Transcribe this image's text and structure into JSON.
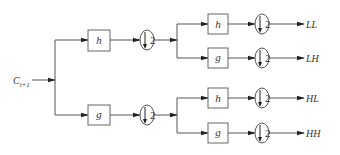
{
  "diagram": {
    "input": {
      "label": "C",
      "subscript": "i+1"
    },
    "level1": [
      {
        "filter": "h",
        "downsample": "2"
      },
      {
        "filter": "g",
        "downsample": "2"
      }
    ],
    "level2": [
      {
        "filter": "h",
        "downsample": "2",
        "output": "LL"
      },
      {
        "filter": "g",
        "downsample": "2",
        "output": "LH"
      },
      {
        "filter": "h",
        "downsample": "2",
        "output": "HL"
      },
      {
        "filter": "g",
        "downsample": "2",
        "output": "HH"
      }
    ],
    "colors": {
      "line": "#555555",
      "text": "#333333",
      "background": "#ffffff"
    }
  }
}
